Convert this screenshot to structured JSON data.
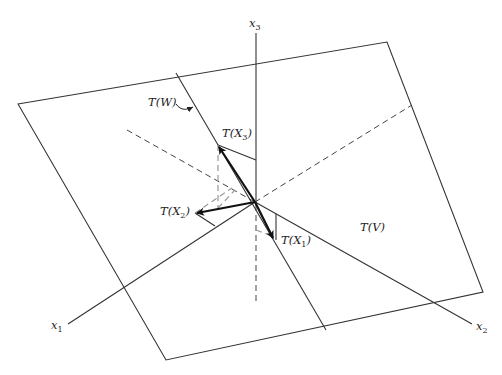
{
  "figure": {
    "axes": {
      "x1": {
        "label": "x",
        "sub": "1"
      },
      "x2": {
        "label": "x",
        "sub": "2"
      },
      "x3": {
        "label": "x",
        "sub": "3"
      }
    },
    "labels": {
      "plane_v": {
        "prefix": "T(",
        "script": "V",
        "suffix": ")"
      },
      "plane_w": {
        "prefix": "T(",
        "script": "W",
        "suffix": ")"
      },
      "tx1": {
        "prefix": "T(X",
        "sub": "1",
        "suffix": ")"
      },
      "tx2": {
        "prefix": "T(X",
        "sub": "2",
        "suffix": ")"
      },
      "tx3": {
        "prefix": "T(X",
        "sub": "3",
        "suffix": ")"
      }
    },
    "colors": {
      "line": "#333333",
      "vector": "#111111",
      "projection": "#999999"
    }
  }
}
